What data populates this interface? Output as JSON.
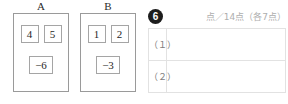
{
  "figure": {
    "panels": [
      {
        "label": "A",
        "top_tiles": [
          "4",
          "5"
        ],
        "bottom_tiles": [
          "−6"
        ]
      },
      {
        "label": "B",
        "top_tiles": [
          "1",
          "2"
        ],
        "bottom_tiles": [
          "−3"
        ]
      }
    ]
  },
  "score_panel": {
    "question_number": "6",
    "score_allocation": "点／14点（各7点）",
    "rows": [
      {
        "label": "（１）",
        "answer": ""
      },
      {
        "label": "（２）",
        "answer": ""
      }
    ]
  },
  "colors": {
    "panel_border": "#9a9a9a",
    "tile_border": "#a5a5a5",
    "table_border": "#e2e2e2",
    "badge_background": "#1d1d1d",
    "allocation_text": "#aeaeae"
  }
}
